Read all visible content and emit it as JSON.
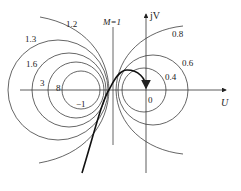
{
  "diagram": {
    "type": "constant-M circles (Nichols/Nyquist M-circles)",
    "axes": {
      "x_label": "U",
      "y_label": "jV",
      "origin_label": "0",
      "minus_one_label": "−1"
    },
    "m1_line_label": "M=1",
    "left_circle_labels": [
      "1.2",
      "1.3",
      "1.6",
      "3",
      "8"
    ],
    "right_circle_labels": [
      "0.8",
      "0.6",
      "0.4"
    ],
    "colors": {
      "lines": "#333333",
      "curve": "#111111",
      "background": "#ffffff"
    }
  }
}
